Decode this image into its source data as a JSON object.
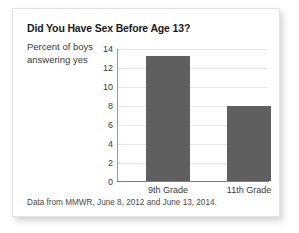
{
  "chart_data": {
    "type": "bar",
    "title": "Did You Have Sex Before Age 13?",
    "ylabel": "Percent of boys answering yes",
    "xlabel": "",
    "categories": [
      "9th Grade",
      "11th Grade"
    ],
    "values": [
      13.3,
      8.0
    ],
    "ylim": [
      0,
      14
    ],
    "yticks": [
      0,
      2,
      4,
      6,
      8,
      10,
      12,
      14
    ],
    "ytick_labels": [
      "0",
      "2",
      "4",
      "6",
      "8",
      "10",
      "12",
      "14"
    ],
    "grid": true,
    "legend": false,
    "bar_color": "#5f5f5f",
    "gridline_color": "#e6e6e6",
    "axis_color": "#7d7d7d",
    "source_note": "Data from MMWR, June 8, 2012 and June 13, 2014."
  }
}
